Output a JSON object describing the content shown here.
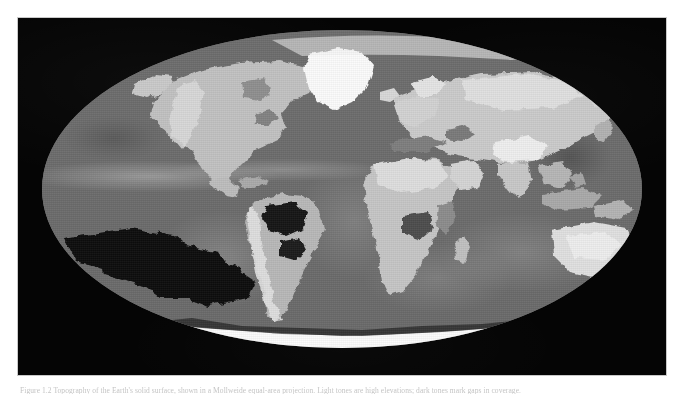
{
  "figure": {
    "caption_label": "Figure 1.2",
    "caption_text": "Figure 1.2 Topography of the Earth's solid surface, shown in a Mollweide equal-area projection. Light tones are high elevations; dark tones mark gaps in coverage.",
    "panel_background": "#050505",
    "border_color": "#c9c9c9"
  },
  "map": {
    "title": "Global topography and bathymetry",
    "projection": "Mollweide",
    "rendering": "grayscale shaded relief",
    "palette": {
      "space": "#050505",
      "ocean": "#6e6e6e",
      "shelf": "#8c8c8c",
      "lowland": "#b4b4b4",
      "upland": "#cfcfcf",
      "highland": "#e6e6e6",
      "ice": "#fbfbfb",
      "nodata": "#0a0a0a"
    },
    "features": [
      {
        "name": "Greenland",
        "tone": "ice"
      },
      {
        "name": "Antarctica",
        "tone": "ice"
      },
      {
        "name": "North America",
        "tone": "upland"
      },
      {
        "name": "South America",
        "tone": "lowland"
      },
      {
        "name": "Africa",
        "tone": "upland"
      },
      {
        "name": "Eurasia",
        "tone": "upland"
      },
      {
        "name": "Himalaya / Tibetan Plateau",
        "tone": "highland"
      },
      {
        "name": "Australia",
        "tone": "upland"
      },
      {
        "name": "Amazon Basin",
        "tone": "nodata"
      },
      {
        "name": "South Pacific data gaps",
        "tone": "nodata"
      },
      {
        "name": "Mid-ocean ridges",
        "tone": "shelf"
      }
    ],
    "legend_visible": false,
    "graticule_visible": false
  }
}
